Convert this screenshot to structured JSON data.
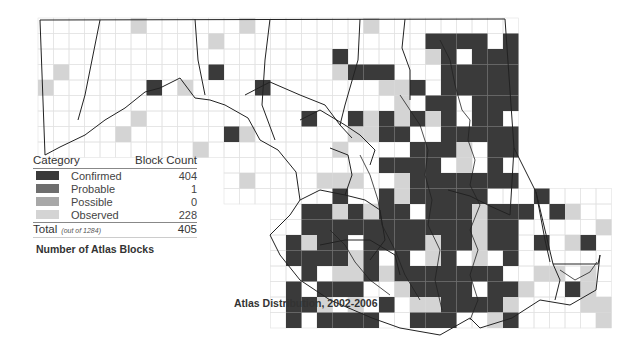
{
  "map": {
    "title": "Atlas Distribution, 2002-2006",
    "region": "Maryland",
    "grid_color": "#dcdcdc",
    "border_color": "#222222"
  },
  "legend": {
    "title": "Number of Atlas Blocks",
    "header_category": "Category",
    "header_count": "Block Count",
    "items": [
      {
        "label": "Confirmed",
        "count": "404",
        "color": "#3a3a3a"
      },
      {
        "label": "Probable",
        "count": "1",
        "color": "#6e6e6e"
      },
      {
        "label": "Possible",
        "count": "0",
        "color": "#a8a8a8"
      },
      {
        "label": "Observed",
        "count": "228",
        "color": "#d4d4d4"
      }
    ],
    "total_label": "Total",
    "total_note": "(out of 1284)",
    "total_count": "405"
  }
}
